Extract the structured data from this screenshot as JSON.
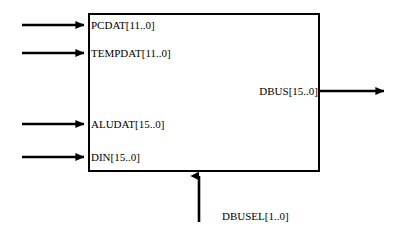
{
  "diagram": {
    "type": "hardware-block-diagram",
    "background_color": "#ffffff",
    "line_color": "#000000",
    "block": {
      "name": "dbus-mux-block",
      "x": 88,
      "y": 13,
      "width": 232,
      "height": 159,
      "border_color": "#000000",
      "border_width": 2,
      "fill": "#ffffff"
    },
    "inputs": [
      {
        "id": "pcdat",
        "label": "PCDAT[11..0]",
        "signal": "PCDAT",
        "bit_range": "[11..0]",
        "width_bits": 12,
        "side": "left",
        "y": 25,
        "arrow_x_start": 22,
        "arrow_x_end": 88,
        "label_x": 91,
        "label_y": 19
      },
      {
        "id": "tempdat",
        "label": "TEMPDAT[11..0]",
        "signal": "TEMPDAT",
        "bit_range": "[11..0]",
        "width_bits": 12,
        "side": "left",
        "y": 53,
        "arrow_x_start": 22,
        "arrow_x_end": 88,
        "label_x": 91,
        "label_y": 51
      },
      {
        "id": "aludat",
        "label": "ALUDAT[15..0]",
        "signal": "ALUDAT",
        "bit_range": "[15..0]",
        "width_bits": 16,
        "side": "left",
        "y": 124,
        "arrow_x_start": 22,
        "arrow_x_end": 88,
        "label_x": 91,
        "label_y": 118
      },
      {
        "id": "din",
        "label": "DIN[15..0]",
        "signal": "DIN",
        "bit_range": "[15..0]",
        "width_bits": 16,
        "side": "left",
        "y": 157,
        "arrow_x_start": 22,
        "arrow_x_end": 88,
        "label_x": 91,
        "label_y": 151
      }
    ],
    "select_input": {
      "id": "dbusel",
      "label": "DBUSEL[1..0]",
      "signal": "DBUSEL",
      "bit_range": "[1..0]",
      "width_bits": 2,
      "side": "bottom",
      "x": 199,
      "arrow_y_start": 222,
      "arrow_y_end": 172,
      "label_x": 222,
      "label_y": 210
    },
    "outputs": [
      {
        "id": "dbus",
        "label": "DBUS[15..0]",
        "signal": "DBUS",
        "bit_range": "[15..0]",
        "width_bits": 16,
        "side": "right",
        "y": 91,
        "arrow_x_start": 320,
        "arrow_x_end": 388,
        "label_x": 250,
        "label_y": 85,
        "label_width": 68
      }
    ]
  }
}
